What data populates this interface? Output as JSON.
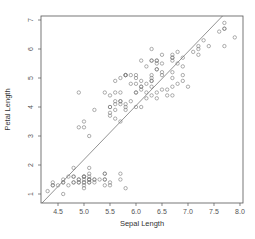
{
  "chart_data": {
    "type": "scatter",
    "title": "",
    "xlabel": "Sepal Length",
    "ylabel": "Petal Length",
    "xlim": [
      4.173,
      8.058
    ],
    "ylim": [
      0.69,
      7.138
    ],
    "xticks": [
      4.5,
      5.0,
      5.5,
      6.0,
      6.5,
      7.0,
      7.5,
      8.0
    ],
    "xtick_labels": [
      "4.5",
      "5.0",
      "5.5",
      "6.0",
      "6.5",
      "7.0",
      "7.5",
      "8.0"
    ],
    "yticks": [
      1,
      2,
      3,
      4,
      5,
      6,
      7
    ],
    "ytick_labels": [
      "1",
      "2",
      "3",
      "4",
      "5",
      "6",
      "7"
    ],
    "grid": false,
    "legend": null,
    "marker": "open-circle",
    "point_color": "#777777",
    "line_color": "#777777",
    "regression_line": {
      "slope": 1.858,
      "intercept": -7.101
    },
    "points": [
      [
        5.1,
        1.4
      ],
      [
        4.9,
        1.4
      ],
      [
        4.7,
        1.3
      ],
      [
        4.6,
        1.5
      ],
      [
        5.0,
        1.4
      ],
      [
        5.4,
        1.7
      ],
      [
        4.6,
        1.4
      ],
      [
        5.0,
        1.5
      ],
      [
        4.4,
        1.4
      ],
      [
        4.9,
        1.5
      ],
      [
        5.4,
        1.5
      ],
      [
        4.8,
        1.6
      ],
      [
        4.8,
        1.4
      ],
      [
        4.3,
        1.1
      ],
      [
        5.8,
        1.2
      ],
      [
        5.7,
        1.5
      ],
      [
        5.4,
        1.3
      ],
      [
        5.1,
        1.4
      ],
      [
        5.7,
        1.7
      ],
      [
        5.1,
        1.5
      ],
      [
        5.4,
        1.7
      ],
      [
        5.1,
        1.5
      ],
      [
        4.6,
        1.0
      ],
      [
        5.1,
        1.7
      ],
      [
        4.8,
        1.9
      ],
      [
        5.0,
        1.6
      ],
      [
        5.0,
        1.6
      ],
      [
        5.2,
        1.5
      ],
      [
        5.2,
        1.4
      ],
      [
        4.7,
        1.6
      ],
      [
        4.8,
        1.6
      ],
      [
        5.4,
        1.5
      ],
      [
        5.2,
        1.5
      ],
      [
        5.5,
        1.4
      ],
      [
        4.9,
        1.5
      ],
      [
        5.0,
        1.2
      ],
      [
        5.5,
        1.3
      ],
      [
        4.9,
        1.4
      ],
      [
        4.4,
        1.3
      ],
      [
        5.1,
        1.5
      ],
      [
        5.0,
        1.3
      ],
      [
        4.5,
        1.3
      ],
      [
        4.4,
        1.3
      ],
      [
        5.0,
        1.6
      ],
      [
        5.1,
        1.9
      ],
      [
        4.8,
        1.4
      ],
      [
        5.1,
        1.6
      ],
      [
        4.6,
        1.4
      ],
      [
        5.3,
        1.5
      ],
      [
        5.0,
        1.4
      ],
      [
        7.0,
        4.7
      ],
      [
        6.4,
        4.5
      ],
      [
        6.9,
        4.9
      ],
      [
        5.5,
        4.0
      ],
      [
        6.5,
        4.6
      ],
      [
        5.7,
        4.5
      ],
      [
        6.3,
        4.7
      ],
      [
        4.9,
        3.3
      ],
      [
        6.6,
        4.6
      ],
      [
        5.2,
        3.9
      ],
      [
        5.0,
        3.5
      ],
      [
        5.9,
        4.2
      ],
      [
        6.0,
        4.0
      ],
      [
        6.1,
        4.7
      ],
      [
        5.6,
        3.6
      ],
      [
        6.7,
        4.4
      ],
      [
        5.6,
        4.5
      ],
      [
        5.8,
        4.1
      ],
      [
        6.2,
        4.5
      ],
      [
        5.6,
        3.9
      ],
      [
        5.9,
        4.8
      ],
      [
        6.1,
        4.0
      ],
      [
        6.3,
        4.9
      ],
      [
        6.1,
        4.7
      ],
      [
        6.4,
        4.3
      ],
      [
        6.6,
        4.4
      ],
      [
        6.8,
        4.8
      ],
      [
        6.7,
        5.0
      ],
      [
        6.0,
        4.5
      ],
      [
        5.7,
        3.5
      ],
      [
        5.5,
        3.8
      ],
      [
        5.5,
        3.7
      ],
      [
        5.8,
        3.9
      ],
      [
        6.0,
        5.1
      ],
      [
        5.4,
        4.5
      ],
      [
        6.0,
        4.5
      ],
      [
        6.7,
        4.7
      ],
      [
        6.3,
        4.4
      ],
      [
        5.6,
        4.1
      ],
      [
        5.5,
        4.0
      ],
      [
        5.5,
        4.4
      ],
      [
        6.1,
        4.6
      ],
      [
        5.8,
        4.0
      ],
      [
        5.0,
        3.3
      ],
      [
        5.6,
        4.2
      ],
      [
        5.7,
        4.2
      ],
      [
        5.7,
        4.2
      ],
      [
        6.2,
        4.3
      ],
      [
        5.1,
        3.0
      ],
      [
        5.7,
        4.1
      ],
      [
        6.3,
        6.0
      ],
      [
        5.8,
        5.1
      ],
      [
        7.1,
        5.9
      ],
      [
        6.3,
        5.6
      ],
      [
        6.5,
        5.8
      ],
      [
        7.6,
        6.6
      ],
      [
        4.9,
        4.5
      ],
      [
        7.3,
        6.3
      ],
      [
        6.7,
        5.8
      ],
      [
        7.2,
        6.1
      ],
      [
        6.5,
        5.1
      ],
      [
        6.4,
        5.3
      ],
      [
        6.8,
        5.5
      ],
      [
        5.7,
        5.0
      ],
      [
        5.8,
        5.1
      ],
      [
        6.4,
        5.3
      ],
      [
        6.5,
        5.5
      ],
      [
        7.7,
        6.7
      ],
      [
        7.7,
        6.9
      ],
      [
        6.0,
        5.0
      ],
      [
        6.9,
        5.7
      ],
      [
        5.6,
        4.9
      ],
      [
        7.7,
        6.7
      ],
      [
        6.3,
        4.9
      ],
      [
        6.7,
        5.7
      ],
      [
        7.2,
        6.0
      ],
      [
        6.2,
        4.8
      ],
      [
        6.1,
        4.9
      ],
      [
        6.4,
        5.6
      ],
      [
        7.2,
        5.8
      ],
      [
        7.4,
        6.1
      ],
      [
        7.9,
        6.4
      ],
      [
        6.4,
        5.6
      ],
      [
        6.3,
        5.1
      ],
      [
        6.1,
        5.6
      ],
      [
        7.7,
        6.1
      ],
      [
        6.3,
        5.6
      ],
      [
        6.4,
        5.5
      ],
      [
        6.0,
        4.8
      ],
      [
        6.9,
        5.4
      ],
      [
        6.7,
        5.6
      ],
      [
        6.9,
        5.1
      ],
      [
        5.8,
        5.1
      ],
      [
        6.8,
        5.9
      ],
      [
        6.7,
        5.7
      ],
      [
        6.7,
        5.2
      ],
      [
        6.3,
        5.0
      ],
      [
        6.5,
        5.2
      ],
      [
        6.2,
        5.4
      ],
      [
        5.9,
        5.1
      ]
    ]
  },
  "layout": {
    "plot_box": {
      "left": 41,
      "top": 16,
      "right": 243,
      "bottom": 203
    }
  }
}
